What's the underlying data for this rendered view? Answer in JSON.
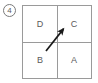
{
  "figure": {
    "index_label": "4",
    "index_shape": "circled-number"
  },
  "grid": {
    "rows": 2,
    "columns": 2,
    "border_color": "#9a9a9a",
    "background_color": "#ffffff",
    "label_color": "#5a5a5a",
    "cells": [
      {
        "position": "top-left",
        "label": "D"
      },
      {
        "position": "top-right",
        "label": "C"
      },
      {
        "position": "bottom-left",
        "label": "B"
      },
      {
        "position": "bottom-right",
        "label": "A"
      }
    ]
  },
  "arrow": {
    "color": "#1a1a1a",
    "direction": "up-right",
    "points_to_cell": "C",
    "tail": {
      "x": 46,
      "y": 51
    },
    "tip": {
      "x": 65,
      "y": 27
    }
  }
}
